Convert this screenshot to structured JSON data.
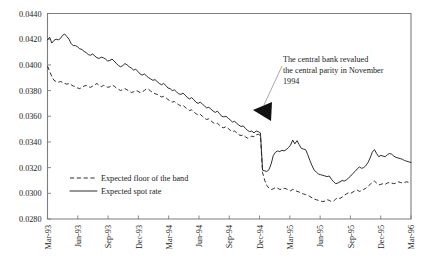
{
  "chart_data": {
    "type": "line",
    "title": "",
    "xlabel": "",
    "ylabel": "",
    "ylim": [
      0.028,
      0.044
    ],
    "ytick_values": [
      0.028,
      0.03,
      0.032,
      0.034,
      0.036,
      0.038,
      0.04,
      0.042,
      0.044
    ],
    "ytick_labels": [
      "0.0280",
      "0.0300",
      "0.0320",
      "0.0340",
      "0.0360",
      "0.0380",
      "0.0400",
      "0.0420",
      "0.0440"
    ],
    "xtick_labels": [
      "Mar-93",
      "Jun-93",
      "Sep-93",
      "Dec-93",
      "Mar-94",
      "Jun-94",
      "Sep-94",
      "Dec-94",
      "Mar-95",
      "Jun-95",
      "Sep-95",
      "Dec-95",
      "Mar-96"
    ],
    "x_start": "Mar-93",
    "x_end": "Mar-96",
    "grid": false,
    "legend_position": "inside-lower-left",
    "series": [
      {
        "name": "Expected spot rate",
        "style": "solid",
        "values": [
          0.04195,
          0.04215,
          0.0417,
          0.0419,
          0.042,
          0.04195,
          0.04205,
          0.0423,
          0.0424,
          0.0422,
          0.042,
          0.04165,
          0.0415,
          0.0415,
          0.0414,
          0.04125,
          0.0412,
          0.04105,
          0.04095,
          0.0408,
          0.04075,
          0.04085,
          0.0407,
          0.04055,
          0.0405,
          0.0406,
          0.04055,
          0.04045,
          0.0403,
          0.04035,
          0.04045,
          0.0403,
          0.0401,
          0.03995,
          0.03985,
          0.03995,
          0.0401,
          0.04,
          0.03985,
          0.03975,
          0.0396,
          0.03965,
          0.0395,
          0.0393,
          0.0392,
          0.0393,
          0.03915,
          0.039,
          0.0389,
          0.0388,
          0.03885,
          0.0387,
          0.03855,
          0.03845,
          0.03855,
          0.0384,
          0.0382,
          0.03815,
          0.038,
          0.03805,
          0.0379,
          0.03775,
          0.0377,
          0.0378,
          0.03765,
          0.03745,
          0.03735,
          0.03745,
          0.0373,
          0.0371,
          0.037,
          0.0371,
          0.03695,
          0.0368,
          0.03665,
          0.0367,
          0.03655,
          0.0364,
          0.0363,
          0.0364,
          0.0362,
          0.036,
          0.03595,
          0.036,
          0.03585,
          0.0357,
          0.03555,
          0.0356,
          0.03545,
          0.0353,
          0.0352,
          0.03525,
          0.03505,
          0.0349,
          0.0348,
          0.03485,
          0.0347,
          0.03485,
          0.0348,
          0.0347,
          0.0318,
          0.03175,
          0.0317,
          0.03185,
          0.0323,
          0.03295,
          0.0332,
          0.0333,
          0.03325,
          0.03335,
          0.0333,
          0.0334,
          0.03355,
          0.03375,
          0.03415,
          0.03385,
          0.0341,
          0.0338,
          0.0335,
          0.03345,
          0.0334,
          0.033,
          0.03255,
          0.03215,
          0.0318,
          0.03165,
          0.0315,
          0.03145,
          0.0314,
          0.03135,
          0.0313,
          0.03135,
          0.0311,
          0.0309,
          0.03075,
          0.0308,
          0.0309,
          0.031,
          0.03095,
          0.03105,
          0.0312,
          0.03135,
          0.03155,
          0.0317,
          0.0319,
          0.03205,
          0.03195,
          0.032,
          0.03215,
          0.0324,
          0.03275,
          0.0332,
          0.0334,
          0.0331,
          0.03285,
          0.03295,
          0.0329,
          0.03285,
          0.033,
          0.0331,
          0.03305,
          0.0329,
          0.0328,
          0.03275,
          0.0327,
          0.03265,
          0.03255,
          0.0325,
          0.03245,
          0.0324
        ]
      },
      {
        "name": "Expected floor of the band",
        "style": "dashed",
        "values": [
          0.0399,
          0.0395,
          0.0391,
          0.0388,
          0.0387,
          0.03865,
          0.0387,
          0.03865,
          0.03855,
          0.0385,
          0.03855,
          0.03845,
          0.03835,
          0.0383,
          0.0382,
          0.03815,
          0.03825,
          0.03835,
          0.0384,
          0.0383,
          0.03825,
          0.03835,
          0.03845,
          0.03855,
          0.0384,
          0.0383,
          0.0384,
          0.03835,
          0.03825,
          0.0383,
          0.0384,
          0.03835,
          0.0382,
          0.0381,
          0.038,
          0.0381,
          0.03815,
          0.03805,
          0.03795,
          0.03785,
          0.0379,
          0.038,
          0.03795,
          0.03785,
          0.0379,
          0.038,
          0.03815,
          0.0381,
          0.03795,
          0.03785,
          0.03775,
          0.0377,
          0.0376,
          0.0375,
          0.03755,
          0.03745,
          0.0373,
          0.0372,
          0.0371,
          0.03715,
          0.037,
          0.0369,
          0.0368,
          0.03685,
          0.0367,
          0.03655,
          0.03645,
          0.0365,
          0.03635,
          0.0362,
          0.0361,
          0.03615,
          0.036,
          0.03585,
          0.03575,
          0.0358,
          0.03565,
          0.0355,
          0.0354,
          0.03545,
          0.0353,
          0.03515,
          0.0351,
          0.0352,
          0.03505,
          0.0349,
          0.0348,
          0.03485,
          0.0347,
          0.03455,
          0.0345,
          0.03455,
          0.0344,
          0.0343,
          0.03435,
          0.03445,
          0.0344,
          0.03455,
          0.0346,
          0.0345,
          0.0316,
          0.031,
          0.0306,
          0.0304,
          0.0303,
          0.03035,
          0.03045,
          0.0304,
          0.0303,
          0.03035,
          0.0304,
          0.03035,
          0.03025,
          0.0302,
          0.0303,
          0.03025,
          0.03015,
          0.0301,
          0.03,
          0.02995,
          0.0299,
          0.02985,
          0.02975,
          0.02965,
          0.02955,
          0.0295,
          0.02945,
          0.0294,
          0.02935,
          0.0294,
          0.0295,
          0.02945,
          0.02935,
          0.0294,
          0.02955,
          0.02965,
          0.0296,
          0.0297,
          0.02985,
          0.02995,
          0.03005,
          0.03,
          0.0301,
          0.0302,
          0.03025,
          0.03015,
          0.0302,
          0.0303,
          0.0304,
          0.03055,
          0.0307,
          0.03085,
          0.03095,
          0.0308,
          0.03065,
          0.0307,
          0.03075,
          0.0307,
          0.0308,
          0.03085,
          0.0308,
          0.03075,
          0.0308,
          0.0309,
          0.03085,
          0.0308,
          0.03085,
          0.0309,
          0.03085,
          0.0309
        ]
      }
    ],
    "annotations": [
      {
        "name": "revaluation-note",
        "lines": [
          "The central bank revalued",
          "the central parity in November",
          "1994"
        ],
        "points_to": "Dec-94"
      }
    ],
    "legend": [
      {
        "label": "Expected floor of the band",
        "style": "dashed"
      },
      {
        "label": "Expected spot rate",
        "style": "solid"
      }
    ],
    "colors": {
      "line": "#232323",
      "frame": "#7d7d7d",
      "text": "#1a1a1a",
      "background": "#ffffff"
    }
  }
}
